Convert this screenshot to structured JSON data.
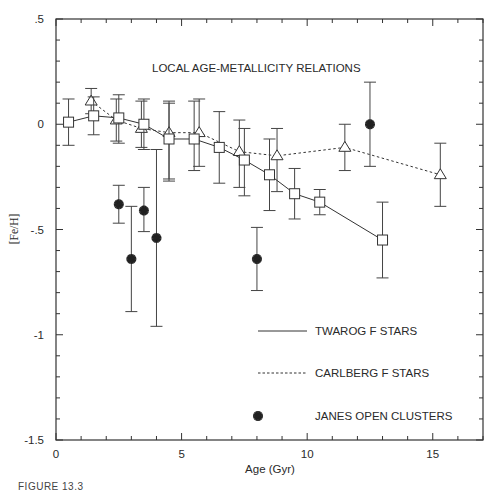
{
  "chart_data": {
    "type": "scatter",
    "title": "LOCAL AGE-METALLICITY RELATIONS",
    "xlabel": "Age (Gyr)",
    "ylabel": "[Fe/H]",
    "xlim": [
      0,
      17
    ],
    "ylim": [
      -1.5,
      0.5
    ],
    "xticks": [
      0,
      5,
      10,
      15
    ],
    "xtick_labels": [
      "0",
      "5",
      "10",
      "15"
    ],
    "yticks": [
      0.5,
      0,
      -0.5,
      -1,
      -1.5
    ],
    "ytick_labels": [
      ".5",
      "0",
      "-.5",
      "-1",
      "-1.5"
    ],
    "x_minor_step": 1,
    "y_minor_step": 0.1,
    "grid": false,
    "legend_position": "lower right (inside)",
    "series": [
      {
        "name": "TWAROG F STARS",
        "marker": "square",
        "line": "solid",
        "x": [
          0.5,
          1.5,
          2.5,
          3.5,
          4.5,
          5.5,
          6.5,
          7.5,
          8.5,
          9.5,
          10.5,
          13.0
        ],
        "y": [
          0.01,
          0.04,
          0.03,
          0.0,
          -0.07,
          -0.07,
          -0.11,
          -0.17,
          -0.24,
          -0.33,
          -0.37,
          -0.55
        ],
        "err_hi": [
          0.11,
          0.09,
          0.11,
          0.12,
          0.17,
          0.18,
          0.17,
          0.15,
          0.17,
          0.12,
          0.06,
          0.18
        ],
        "err_lo": [
          0.11,
          0.09,
          0.12,
          0.12,
          0.19,
          0.15,
          0.17,
          0.17,
          0.17,
          0.12,
          0.06,
          0.18
        ]
      },
      {
        "name": "CARLBERG F STARS",
        "marker": "triangle",
        "line": "dotted",
        "x": [
          1.4,
          2.4,
          3.4,
          4.5,
          5.7,
          7.3,
          8.8,
          11.5,
          15.3
        ],
        "y": [
          0.11,
          0.02,
          -0.02,
          -0.04,
          -0.04,
          -0.13,
          -0.15,
          -0.11,
          -0.24
        ],
        "err_hi": [
          0.06,
          0.1,
          0.13,
          0.15,
          0.16,
          0.15,
          0.13,
          0.11,
          0.15
        ],
        "err_lo": [
          0.06,
          0.1,
          0.09,
          0.23,
          0.16,
          0.17,
          0.17,
          0.11,
          0.15
        ]
      },
      {
        "name": "JANES OPEN CLUSTERS",
        "marker": "asterisk",
        "line": "none",
        "x": [
          2.5,
          3.0,
          3.5,
          4.0,
          8.0,
          12.5
        ],
        "y": [
          -0.38,
          -0.64,
          -0.41,
          -0.54,
          -0.64,
          0.0
        ],
        "err_hi": [
          0.09,
          0.25,
          0.11,
          0.42,
          0.15,
          0.2
        ],
        "err_lo": [
          0.09,
          0.25,
          0.1,
          0.42,
          0.15,
          0.2
        ]
      }
    ]
  },
  "caption": "FIGURE 13.3"
}
